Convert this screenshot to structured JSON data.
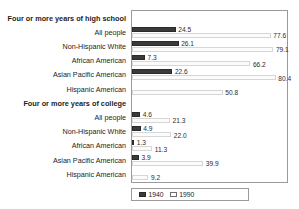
{
  "chart_data": {
    "type": "bar",
    "orientation": "horizontal",
    "title": "",
    "xlabel": "",
    "ylabel": "",
    "xlim": [
      0,
      85
    ],
    "grid": false,
    "legend_position": "bottom-left",
    "series": [
      {
        "name": "1940",
        "color": "#3a3a3a"
      },
      {
        "name": "1990",
        "color": "#ffffff"
      }
    ],
    "sections": [
      {
        "label": "Four or more years of high school",
        "rows": [
          {
            "category": "All people",
            "v1940": 24.5,
            "v1990": 77.6
          },
          {
            "category": "Non-Hispanic White",
            "v1940": 26.1,
            "v1990": 79.1
          },
          {
            "category": "African American",
            "v1940": 7.3,
            "v1990": 66.2
          },
          {
            "category": "Asian Pacific American",
            "v1940": 22.6,
            "v1990": 80.4
          },
          {
            "category": "Hispanic American",
            "v1940": null,
            "v1990": 50.8
          }
        ]
      },
      {
        "label": "Four or more years of college",
        "rows": [
          {
            "category": "All people",
            "v1940": 4.6,
            "v1990": 21.3
          },
          {
            "category": "Non-Hispanic White",
            "v1940": 4.9,
            "v1990": 22.0
          },
          {
            "category": "African American",
            "v1940": 1.3,
            "v1990": 11.3
          },
          {
            "category": "Asian Pacific American",
            "v1940": 3.9,
            "v1990": 39.9
          },
          {
            "category": "Hispanic American",
            "v1940": null,
            "v1990": 9.2
          }
        ]
      }
    ]
  },
  "legend": {
    "items": [
      {
        "label": "1940",
        "swatch": "dark"
      },
      {
        "label": "1990",
        "swatch": "light"
      }
    ]
  }
}
